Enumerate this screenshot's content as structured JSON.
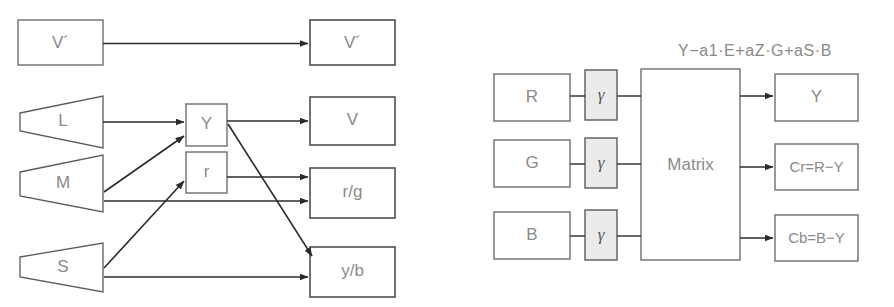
{
  "diagram": {
    "left_panel": {
      "name": "opponent-color-processing",
      "inputs": [
        {
          "id": "vprime_in",
          "label": "V´",
          "shape": "rect"
        },
        {
          "id": "cone_l",
          "label": "L",
          "shape": "cone"
        },
        {
          "id": "cone_m",
          "label": "M",
          "shape": "cone"
        },
        {
          "id": "cone_s",
          "label": "S",
          "shape": "cone"
        }
      ],
      "intermediates": [
        {
          "id": "node_y",
          "label": "Y",
          "shape": "rect"
        },
        {
          "id": "node_r",
          "label": "r",
          "shape": "rect"
        }
      ],
      "outputs": [
        {
          "id": "vprime_out",
          "label": "V´",
          "shape": "rect"
        },
        {
          "id": "out_v",
          "label": "V",
          "shape": "rect"
        },
        {
          "id": "out_rg",
          "label": "r/g",
          "shape": "rect"
        },
        {
          "id": "out_yb",
          "label": "y/b",
          "shape": "rect"
        }
      ],
      "connections": [
        {
          "from": "vprime_in",
          "to": "vprime_out"
        },
        {
          "from": "cone_l",
          "to": "node_y"
        },
        {
          "from": "cone_m",
          "to": "node_y"
        },
        {
          "from": "cone_m",
          "to": "out_rg"
        },
        {
          "from": "cone_s",
          "to": "node_r"
        },
        {
          "from": "cone_s",
          "to": "out_yb"
        },
        {
          "from": "node_y",
          "to": "out_v"
        },
        {
          "from": "node_y",
          "to": "out_yb"
        },
        {
          "from": "node_r",
          "to": "out_rg"
        }
      ]
    },
    "right_panel": {
      "name": "ycbcr-matrix-encoder",
      "formula": "Y−a1·E+aZ·G+aS·B",
      "inputs": [
        {
          "id": "in_r",
          "label": "R"
        },
        {
          "id": "in_g",
          "label": "G"
        },
        {
          "id": "in_b",
          "label": "B"
        }
      ],
      "gamma_blocks": [
        {
          "id": "gamma_r",
          "label": "γ"
        },
        {
          "id": "gamma_g",
          "label": "γ"
        },
        {
          "id": "gamma_b",
          "label": "γ"
        }
      ],
      "matrix": {
        "id": "matrix_block",
        "label": "Matrix"
      },
      "outputs": [
        {
          "id": "out_y",
          "label": "Y"
        },
        {
          "id": "out_cr",
          "label": "Cr=R−Y"
        },
        {
          "id": "out_cb",
          "label": "Cb=B−Y"
        }
      ]
    }
  },
  "colors": {
    "box_stroke": "#6e6e6e",
    "gamma_fill": "#ebebeb",
    "line": "#2b2b2b",
    "text": "#8a8a8a",
    "background": "#ffffff"
  }
}
